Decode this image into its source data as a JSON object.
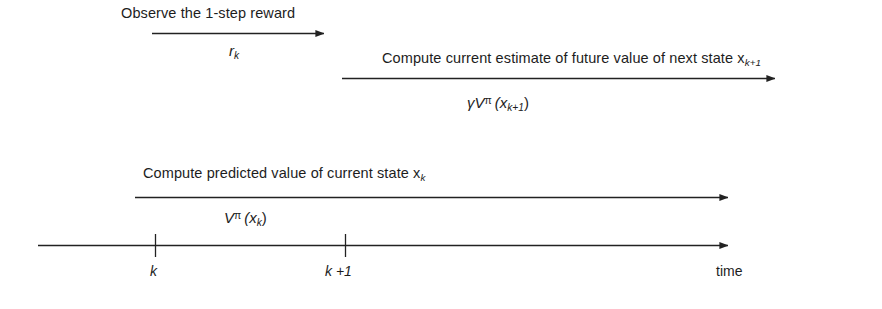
{
  "figure": {
    "type": "timeline-diagram",
    "background_color": "#ffffff",
    "line_color": "#222222"
  },
  "flows": [
    {
      "id": "reward-flow",
      "caption": "Observe the 1-step reward",
      "symbol_main": "r",
      "symbol_sub": "k",
      "arrow": {
        "x1": 152,
        "x2": 324,
        "y": 33
      }
    },
    {
      "id": "future-value-flow",
      "caption": "Compute current estimate of future value of next state x",
      "caption_sub": "k+1",
      "symbol_gamma": "γ",
      "symbol_main": "V",
      "symbol_sup": "π",
      "symbol_arg": "(x",
      "symbol_arg_sub": "k+1",
      "symbol_arg_close": ")",
      "arrow": {
        "x1": 342,
        "x2": 775,
        "y": 78
      }
    },
    {
      "id": "predicted-value-flow",
      "caption": "Compute predicted value of current state x",
      "caption_sub": "k",
      "symbol_main": "V",
      "symbol_sup": "π",
      "symbol_arg": "(x",
      "symbol_arg_sub": "k",
      "symbol_arg_close": ")",
      "arrow": {
        "x1": 135,
        "x2": 728,
        "y": 197
      }
    }
  ],
  "time_axis": {
    "label": "time",
    "arrow": {
      "x1": 38,
      "x2": 728,
      "y": 245
    },
    "ticks": [
      {
        "label": "k",
        "x": 155
      },
      {
        "label": "k +1",
        "x": 345
      }
    ]
  }
}
